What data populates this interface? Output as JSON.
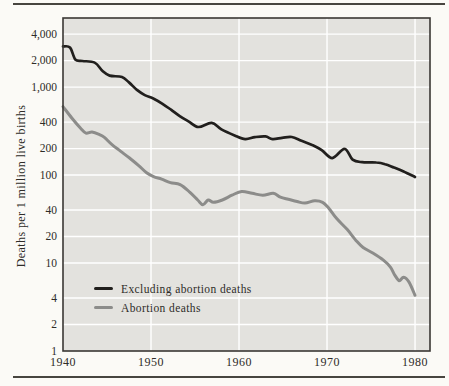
{
  "figure": {
    "y_axis_title": "Deaths per 1 million live births"
  },
  "theme": {
    "page_bg": "#fbfaf6",
    "panel_bg": "#e3e2de",
    "gridline": "#ffffff",
    "frame": "#3a3834",
    "rule": "#47453f",
    "text": "#2e2c28",
    "series_black": "#211f1d",
    "series_gray": "#8c8c8a"
  },
  "chart_data": {
    "type": "line",
    "title": "",
    "xlabel": "",
    "ylabel": "Deaths per 1 million live births",
    "y_scale": "log",
    "xlim": [
      1940,
      1981.7
    ],
    "ylim": [
      1,
      6100
    ],
    "grid": "white gridlines on gray panel",
    "legend_position": "inside lower-left",
    "x_ticks": [
      {
        "value": 1940,
        "label": "1940",
        "gridline": false
      },
      {
        "value": 1950,
        "label": "1950",
        "gridline": true
      },
      {
        "value": 1960,
        "label": "1960",
        "gridline": true
      },
      {
        "value": 1970,
        "label": "1970",
        "gridline": true
      },
      {
        "value": 1980,
        "label": "1980",
        "gridline": true
      }
    ],
    "y_ticks": [
      {
        "value": 4000,
        "label": "4,000",
        "gridline": true
      },
      {
        "value": 2000,
        "label": "2,000",
        "gridline": true
      },
      {
        "value": 1000,
        "label": "1,000",
        "gridline": true
      },
      {
        "value": 400,
        "label": "400",
        "gridline": true
      },
      {
        "value": 200,
        "label": "200",
        "gridline": true
      },
      {
        "value": 100,
        "label": "100",
        "gridline": true
      },
      {
        "value": 40,
        "label": "40",
        "gridline": true
      },
      {
        "value": 20,
        "label": "20",
        "gridline": true
      },
      {
        "value": 10,
        "label": "10",
        "gridline": true
      },
      {
        "value": 4,
        "label": "4",
        "gridline": true
      },
      {
        "value": 2,
        "label": "2",
        "gridline": true
      },
      {
        "value": 1,
        "label": "1",
        "gridline": false
      }
    ],
    "series": [
      {
        "name": "Excluding abortion deaths",
        "color": "#211f1d",
        "width": 2.7,
        "points": [
          [
            1940,
            2900
          ],
          [
            1940.8,
            2820
          ],
          [
            1941.4,
            2060
          ],
          [
            1942.2,
            1980
          ],
          [
            1943.6,
            1900
          ],
          [
            1944.5,
            1520
          ],
          [
            1945.3,
            1350
          ],
          [
            1946.7,
            1300
          ],
          [
            1947.5,
            1130
          ],
          [
            1948.4,
            930
          ],
          [
            1949.3,
            810
          ],
          [
            1950.2,
            745
          ],
          [
            1951.3,
            645
          ],
          [
            1952.3,
            550
          ],
          [
            1953.3,
            465
          ],
          [
            1954.3,
            405
          ],
          [
            1955.4,
            352
          ],
          [
            1956.9,
            392
          ],
          [
            1958,
            330
          ],
          [
            1959.5,
            282
          ],
          [
            1960.7,
            256
          ],
          [
            1961.8,
            270
          ],
          [
            1963,
            275
          ],
          [
            1963.8,
            256
          ],
          [
            1964.9,
            265
          ],
          [
            1966,
            271
          ],
          [
            1967.1,
            245
          ],
          [
            1968.3,
            220
          ],
          [
            1969.4,
            192
          ],
          [
            1970.6,
            156
          ],
          [
            1972,
            199
          ],
          [
            1972.9,
            150
          ],
          [
            1974,
            140
          ],
          [
            1975.6,
            139
          ],
          [
            1976.6,
            133
          ],
          [
            1977.6,
            122
          ],
          [
            1978.7,
            110
          ],
          [
            1980,
            95
          ]
        ]
      },
      {
        "name": "Abortion deaths",
        "color": "#8c8c8a",
        "width": 3,
        "points": [
          [
            1940,
            600
          ],
          [
            1941,
            445
          ],
          [
            1942,
            340
          ],
          [
            1942.6,
            300
          ],
          [
            1943.3,
            308
          ],
          [
            1944.1,
            290
          ],
          [
            1944.7,
            268
          ],
          [
            1945.6,
            220
          ],
          [
            1946.6,
            185
          ],
          [
            1947.6,
            155
          ],
          [
            1948.6,
            128
          ],
          [
            1949.5,
            106
          ],
          [
            1950.3,
            96
          ],
          [
            1951.2,
            90
          ],
          [
            1952.2,
            82
          ],
          [
            1953.3,
            78
          ],
          [
            1954.4,
            64
          ],
          [
            1955.3,
            52
          ],
          [
            1955.9,
            46
          ],
          [
            1956.5,
            52
          ],
          [
            1957.1,
            49
          ],
          [
            1958.1,
            52
          ],
          [
            1959.2,
            59
          ],
          [
            1960.3,
            65
          ],
          [
            1961.5,
            62
          ],
          [
            1962.7,
            59
          ],
          [
            1963.9,
            62
          ],
          [
            1964.7,
            56
          ],
          [
            1965.6,
            53
          ],
          [
            1966.6,
            50
          ],
          [
            1967.5,
            48
          ],
          [
            1968.6,
            51
          ],
          [
            1969.5,
            49
          ],
          [
            1970.2,
            42
          ],
          [
            1971.1,
            32
          ],
          [
            1972.3,
            24
          ],
          [
            1973.4,
            17.5
          ],
          [
            1974.1,
            15
          ],
          [
            1975.2,
            13
          ],
          [
            1976.4,
            10.8
          ],
          [
            1977.2,
            9
          ],
          [
            1977.7,
            7.3
          ],
          [
            1978.2,
            6.3
          ],
          [
            1978.7,
            6.9
          ],
          [
            1979.3,
            6.1
          ],
          [
            1980,
            4.3
          ]
        ]
      }
    ]
  }
}
